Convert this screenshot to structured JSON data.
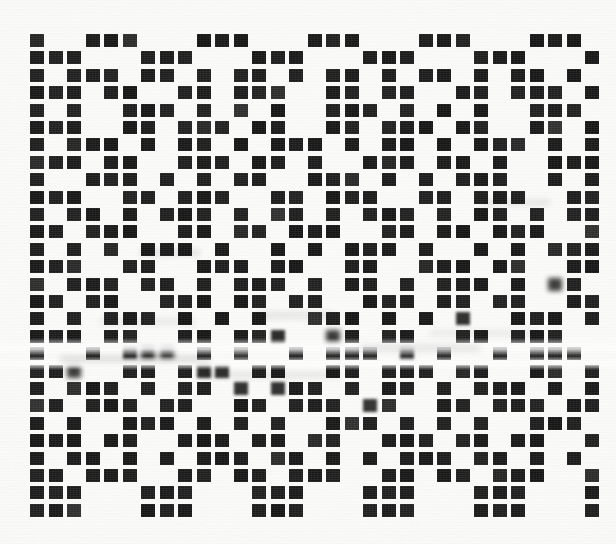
{
  "document": {
    "kind": "scanned-binary-dot-matrix",
    "caption": "",
    "background_color": "#fbfbf9",
    "ink_color": "#1d1d1d"
  },
  "matrix": {
    "columns": 31,
    "rows": 28,
    "origin_x": 30,
    "origin_y": 34,
    "pitch_x": 18.5,
    "pitch_y": 17.4,
    "cell_width": 14,
    "cell_height": 13,
    "legend": "1 = filled black square, 0 = blank paper",
    "rows_bits": [
      "1001110001110001110001110001110",
      "1110001110001110001110001110001",
      "1011101101011010110101101011010",
      "1110110011011100110110011011101",
      "1010011101010100111010101001110",
      "1110011011101100110111011001101",
      "1011101011010111010110101110101",
      "1110110011101101001110110100111",
      "1001110101011001110101011100101",
      "1110011011100110111001101110011",
      "1011010111010110101110101101011",
      "1101110011011011100110110111001",
      "1010101110100101011101001010111",
      "1110011001110110011001110110011",
      "1011101101011101011010111010110",
      "1101100111011011001110110110011",
      "1010111010101001110101010011101",
      "1110110011011100110110011011100",
      "1001011101010010111010100101110",
      "1110011011101100110111011001101",
      "1011101011010111010110101110101",
      "1101110110011011101100110111011",
      "1010011101010100111010101001110",
      "1110110011101101100111011011001",
      "1011010101110110101011101101010",
      "1101110011011011100110110111001",
      "1110001110001110001110001110001",
      "1110001110001110001110001110001"
    ]
  },
  "artifacts": {
    "bands": [
      {
        "y": 338,
        "height": 18,
        "label": "scan-band-upper"
      },
      {
        "y": 356,
        "height": 14,
        "label": "scan-band-lower"
      }
    ],
    "smears": [
      {
        "x": 100,
        "y": 318,
        "w": 95,
        "h": 7
      },
      {
        "x": 255,
        "y": 312,
        "w": 80,
        "h": 7
      },
      {
        "x": 360,
        "y": 345,
        "w": 120,
        "h": 6
      },
      {
        "x": 60,
        "y": 356,
        "w": 150,
        "h": 6
      },
      {
        "x": 430,
        "y": 330,
        "w": 110,
        "h": 6
      },
      {
        "x": 200,
        "y": 372,
        "w": 140,
        "h": 6
      },
      {
        "x": 480,
        "y": 200,
        "w": 70,
        "h": 5
      },
      {
        "x": 140,
        "y": 250,
        "w": 60,
        "h": 5
      }
    ],
    "smear_cells": [
      [
        13,
        17
      ],
      [
        14,
        17
      ],
      [
        15,
        17
      ],
      [
        16,
        17
      ],
      [
        5,
        18
      ],
      [
        6,
        18
      ],
      [
        7,
        18
      ],
      [
        8,
        18
      ],
      [
        19,
        18
      ],
      [
        20,
        18
      ],
      [
        21,
        18
      ],
      [
        2,
        19
      ],
      [
        3,
        19
      ],
      [
        9,
        19
      ],
      [
        10,
        19
      ],
      [
        22,
        16
      ],
      [
        23,
        16
      ],
      [
        24,
        16
      ],
      [
        25,
        19
      ],
      [
        26,
        19
      ],
      [
        11,
        20
      ],
      [
        12,
        20
      ],
      [
        13,
        20
      ],
      [
        27,
        14
      ],
      [
        28,
        14
      ],
      [
        17,
        21
      ],
      [
        18,
        21
      ]
    ]
  }
}
